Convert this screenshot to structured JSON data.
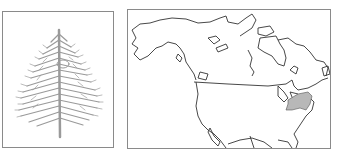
{
  "figure": {
    "tree_panel": {
      "subject": "conifer-tree-silhouette",
      "color": "#9a9a9a"
    },
    "map_panel": {
      "subject": "north-america-outline-map",
      "outline_color": "#333333",
      "range_fill_color": "#b8b8b8",
      "highlighted_region": "northeastern-united-states-range"
    },
    "border_color": "#8a8a8a"
  }
}
